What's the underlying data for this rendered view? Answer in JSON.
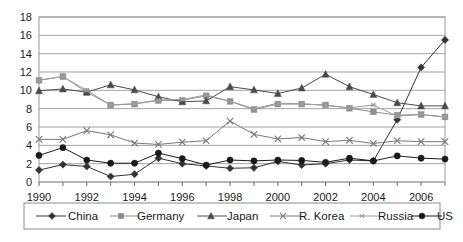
{
  "chart_data": {
    "type": "line",
    "title": "",
    "subtitle": "",
    "xlabel": "",
    "ylabel": "",
    "xlim": [
      1990,
      2007
    ],
    "ylim": [
      0,
      18
    ],
    "y_ticks": [
      0,
      2,
      4,
      6,
      8,
      10,
      12,
      14,
      16,
      18
    ],
    "x_ticks": [
      1990,
      1992,
      1994,
      1996,
      1998,
      2000,
      2002,
      2004,
      2006
    ],
    "x_tick_labels": [
      "1990",
      "1992",
      "1994",
      "1996",
      "1998",
      "2000",
      "2002",
      "2004",
      "2006"
    ],
    "y_tick_labels": [
      "0",
      "2",
      "4",
      "6",
      "8",
      "10",
      "12",
      "14",
      "16",
      "18"
    ],
    "grid": "horizontal",
    "legend_position": "bottom",
    "x": [
      1990,
      1991,
      1992,
      1993,
      1994,
      1995,
      1996,
      1997,
      1998,
      1999,
      2000,
      2001,
      2002,
      2003,
      2004,
      2005,
      2006,
      2007
    ],
    "series": [
      {
        "name": "China",
        "marker": "diamond",
        "color": "#333333",
        "values": [
          1.3,
          1.9,
          1.7,
          0.6,
          0.85,
          2.6,
          2.0,
          1.75,
          1.5,
          1.55,
          2.25,
          1.85,
          2.0,
          2.4,
          2.3,
          6.8,
          12.5,
          15.5
        ]
      },
      {
        "name": "Germany",
        "marker": "square",
        "color": "#8f8f8f",
        "values": [
          11.1,
          11.5,
          9.8,
          8.4,
          8.5,
          8.9,
          8.9,
          9.4,
          8.8,
          7.9,
          8.5,
          8.5,
          8.4,
          8.05,
          7.65,
          7.3,
          7.35,
          7.1
        ]
      },
      {
        "name": "Japan",
        "marker": "triangle",
        "color": "#4a4a4a",
        "values": [
          9.95,
          10.15,
          9.8,
          10.6,
          10.05,
          9.3,
          8.75,
          8.85,
          10.4,
          10.05,
          9.65,
          10.25,
          11.75,
          10.4,
          9.55,
          8.65,
          8.3,
          8.3
        ]
      },
      {
        "name": "R. Korea",
        "marker": "cross",
        "color": "#787878",
        "values": [
          4.65,
          4.65,
          5.6,
          5.15,
          4.25,
          4.1,
          4.35,
          4.5,
          6.65,
          5.2,
          4.7,
          4.85,
          4.4,
          4.55,
          4.2,
          4.5,
          4.4,
          4.4
        ]
      },
      {
        "name": "Russia",
        "marker": "asterisk",
        "color": "#9c9c9c",
        "values": [
          11.1,
          11.5,
          10.0,
          8.4,
          8.55,
          8.95,
          9.0,
          9.5,
          8.8,
          8.0,
          8.6,
          8.55,
          8.35,
          8.1,
          8.4,
          7.2,
          7.35,
          7.1
        ]
      },
      {
        "name": "US",
        "marker": "circle",
        "color": "#1a1a1a",
        "values": [
          2.9,
          3.75,
          2.4,
          2.05,
          2.05,
          3.15,
          2.55,
          1.85,
          2.4,
          2.3,
          2.4,
          2.35,
          2.15,
          2.6,
          2.3,
          2.85,
          2.6,
          2.5
        ]
      }
    ]
  },
  "legend": {
    "entries": [
      {
        "label": "China"
      },
      {
        "label": "Germany"
      },
      {
        "label": "Japan"
      },
      {
        "label": "R. Korea"
      },
      {
        "label": "Russia"
      },
      {
        "label": "US"
      }
    ]
  }
}
